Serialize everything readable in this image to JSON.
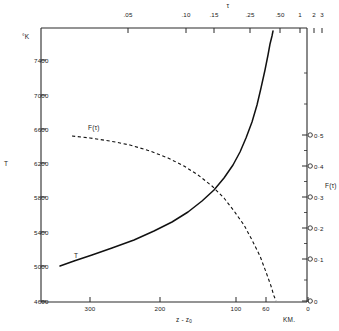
{
  "chart_data": {
    "type": "line",
    "title": "",
    "top_axis": {
      "label": "τ",
      "ticks": [
        ".05",
        ".10",
        ".15",
        ".25",
        ".50",
        "1",
        "2",
        "3"
      ],
      "tick_x": [
        128,
        186,
        214,
        250,
        280,
        300,
        314,
        322
      ]
    },
    "bottom_axis": {
      "label": "z - z",
      "label_sub": "0",
      "unit": "KM.",
      "ticks": [
        "300",
        "200",
        "100",
        "60",
        "0"
      ],
      "tick_x": [
        90,
        160,
        236,
        266,
        308
      ]
    },
    "left_axis": {
      "label": "T",
      "unit": "°K",
      "ticks": [
        "7400",
        "7000",
        "6600",
        "6200",
        "5800",
        "5400",
        "5000",
        "4600"
      ],
      "tick_y": [
        60,
        95,
        129,
        163,
        197,
        232,
        266,
        301
      ],
      "range": [
        4600,
        7400
      ]
    },
    "right_axis": {
      "label": "F(τ)",
      "ticks": [
        "0·5",
        "0·4",
        "0·3",
        "0·2",
        "0·1",
        "0"
      ],
      "tick_y": [
        135,
        166,
        197,
        228,
        259,
        301
      ],
      "range": [
        0,
        0.5
      ]
    },
    "series": [
      {
        "name": "T",
        "style": "solid",
        "label": "T",
        "label_x": 74,
        "label_y": 252,
        "points": "60,266 74,261 92,255 112,248 134,240 154,231 172,222 188,212 202,201 214,190 224,178 233,165 240,152 246,138 252,122 257,105 261,88 265,70 268,55 270,44 272,36 273,31"
      },
      {
        "name": "F(tau)",
        "style": "dashed",
        "label": "F(τ)",
        "label_x": 88,
        "label_y": 124,
        "points": "72,136 90,138 110,141 130,145 150,151 168,158 184,166 198,175 212,186 224,198 234,211 244,225 252,240 260,256 266,272 271,286 274,296 276,301"
      }
    ],
    "frame": {
      "left": 41,
      "right": 307,
      "top": 28,
      "bottom": 302
    }
  }
}
